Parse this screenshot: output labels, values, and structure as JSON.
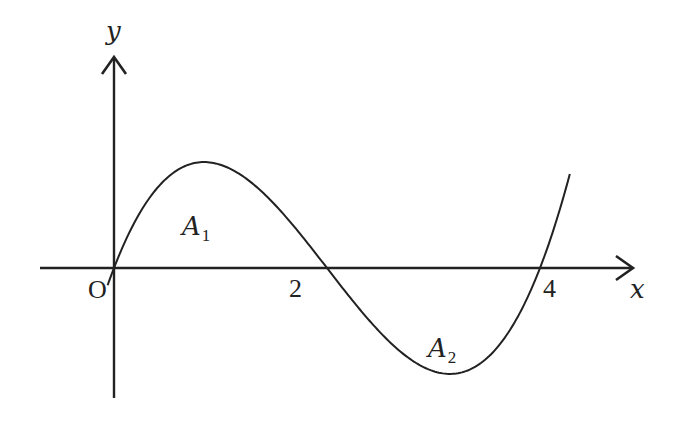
{
  "figure": {
    "colors": {
      "background": "#ffffff",
      "ink": "#222222"
    }
  },
  "axes": {
    "x_label": "x",
    "y_label": "y",
    "origin_label": "O"
  },
  "ticks": {
    "x": [
      {
        "value": 2,
        "label": "2"
      },
      {
        "value": 4,
        "label": "4"
      }
    ]
  },
  "regions": [
    {
      "name": "A",
      "sub": "1",
      "position": "above x-axis between x=0 and x=2"
    },
    {
      "name": "A",
      "sub": "2",
      "position": "below x-axis between x=2 and x=4"
    }
  ],
  "curve": {
    "type": "cubic",
    "roots": [
      0,
      2,
      4
    ],
    "shape": "rises from origin to a maximum, crosses x-axis at 2, falls to a minimum, crosses at 4 and rises"
  }
}
